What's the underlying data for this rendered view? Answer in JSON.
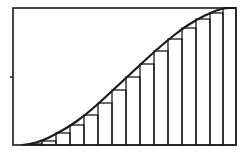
{
  "figure": {
    "colors": {
      "stroke": "#1a1a1a",
      "background": "#ffffff"
    },
    "frame": {
      "x0": 13,
      "y0": 8,
      "x1": 236,
      "y1": 145
    },
    "y_tick": {
      "x": 13,
      "y": 77
    },
    "rect_edges_x": [
      30,
      42,
      56,
      70,
      84,
      98,
      112,
      126,
      140,
      154,
      168,
      182,
      196,
      210,
      223,
      236
    ],
    "rect_tops_y": [
      144,
      141,
      133,
      125,
      115,
      103,
      90,
      77,
      64,
      51,
      39,
      28,
      19,
      13,
      8
    ],
    "curve_points": [
      [
        22,
        145
      ],
      [
        30,
        144
      ],
      [
        42,
        141
      ],
      [
        56,
        134
      ],
      [
        70,
        126
      ],
      [
        84,
        116
      ],
      [
        98,
        104
      ],
      [
        112,
        91
      ],
      [
        126,
        78
      ],
      [
        140,
        65
      ],
      [
        154,
        52
      ],
      [
        168,
        40
      ],
      [
        182,
        29
      ],
      [
        196,
        20
      ],
      [
        210,
        13
      ],
      [
        223,
        8
      ],
      [
        236,
        8
      ]
    ]
  }
}
